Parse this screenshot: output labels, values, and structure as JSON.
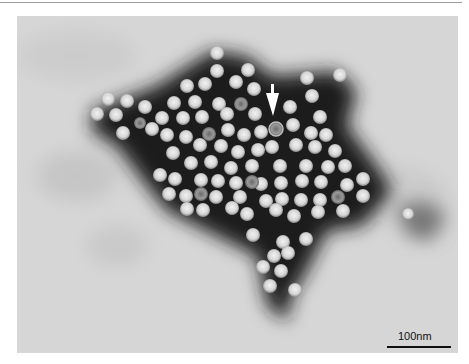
{
  "figure": {
    "type": "negative-stain electron micrograph",
    "arrow_annotation": {
      "x": 273,
      "y": 85,
      "direction": "down",
      "color": "#ffffff"
    },
    "scale_bar": {
      "label": "100nm",
      "color": "#111111"
    },
    "colors": {
      "background": "#d4d4d4",
      "stain": "#1a1a1a",
      "particle": "#e0e0e0",
      "top_rule": "#9a9a9a"
    }
  }
}
